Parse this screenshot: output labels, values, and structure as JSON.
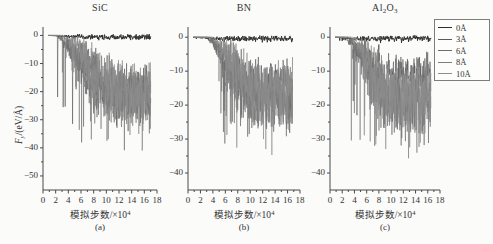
{
  "figure": {
    "background_color": "#fbfbfa",
    "axis_color": "#4a4a4a",
    "text_color": "#333333"
  },
  "legend": {
    "position": "top-right",
    "border_color": "#7d7d7d",
    "entries": [
      {
        "label": "0Å",
        "color": "#2e2e2e"
      },
      {
        "label": "3Å",
        "color": "#5a5a5a"
      },
      {
        "label": "6Å",
        "color": "#6e6e6e"
      },
      {
        "label": "8Å",
        "color": "#7e7e7e"
      },
      {
        "label": "10Å",
        "color": "#8d8d8d"
      }
    ]
  },
  "panels": [
    {
      "tag": "(a)",
      "title": "SiC",
      "title_html": "SiC",
      "xlabel": "模拟步数/×10",
      "xlabel_sup": "4",
      "ylabel": "F",
      "ylabel_sub": "y",
      "ylabel_rest": "/(eV/Å)",
      "xticks": [
        0,
        2,
        4,
        6,
        8,
        10,
        12,
        14,
        16,
        18
      ],
      "yticks": [
        0,
        -10,
        -20,
        -30,
        -40,
        -50
      ],
      "ytick_labels": [
        "0",
        "−10",
        "−20",
        "−30",
        "−40",
        "−50"
      ],
      "xlim": [
        0,
        18
      ],
      "ylim": [
        -55,
        3
      ]
    },
    {
      "tag": "(b)",
      "title": "BN",
      "title_html": "BN",
      "xlabel": "模拟步数/×10",
      "xlabel_sup": "4",
      "xticks": [
        0,
        2,
        4,
        6,
        8,
        10,
        12,
        14,
        16,
        18
      ],
      "yticks": [
        0,
        -10,
        -20,
        -30,
        -40
      ],
      "ytick_labels": [
        "0",
        "−10",
        "−20",
        "−30",
        "−40"
      ],
      "xlim": [
        0,
        18
      ],
      "ylim": [
        -45,
        3
      ]
    },
    {
      "tag": "(c)",
      "title": "Al2O3",
      "title_html": "Al<sub>2</sub>O<sub>3</sub>",
      "xlabel": "模拟步数/×10",
      "xlabel_sup": "4",
      "xticks": [
        0,
        2,
        4,
        6,
        8,
        10,
        12,
        14,
        16,
        18
      ],
      "yticks": [
        0,
        -10,
        -20,
        -30,
        -40
      ],
      "ytick_labels": [
        "0",
        "−10",
        "−20",
        "−30",
        "−40"
      ],
      "xlim": [
        0,
        18
      ],
      "ylim": [
        -45,
        3
      ]
    }
  ],
  "chart_data": {
    "type": "line",
    "title": "",
    "subplots": [
      {
        "tag": "(a)",
        "title": "SiC",
        "xlabel": "模拟步数/×10⁴",
        "ylabel": "F_y/(eV/Å)",
        "xlim": [
          0,
          18
        ],
        "ylim": [
          -55,
          3
        ],
        "xticks": [
          0,
          2,
          4,
          6,
          8,
          10,
          12,
          14,
          16,
          18
        ],
        "yticks": [
          0,
          -10,
          -20,
          -30,
          -40,
          -50
        ],
        "grid": false,
        "series": [
          {
            "name": "0Å",
            "color": "#2e2e2e",
            "x_start": 1.0,
            "x_end": 17.0,
            "mean_envelope": [
              0,
              -0.3,
              -0.4,
              -0.5,
              -0.6,
              -0.5,
              -0.4,
              -0.4,
              -0.4
            ],
            "noise_amplitude": 1.2,
            "description": "near-zero flat noisy trace along y=0"
          },
          {
            "name": "3Å",
            "color": "#5a5a5a",
            "x_start": 2.2,
            "x_end": 17.0,
            "mean_envelope": [
              0,
              -4,
              -9,
              -13,
              -16,
              -18,
              -19,
              -19,
              -18
            ],
            "noise_amplitude": 11,
            "min_value": -42
          },
          {
            "name": "6Å",
            "color": "#6e6e6e",
            "x_start": 2.6,
            "x_end": 17.0,
            "mean_envelope": [
              0,
              -5,
              -11,
              -16,
              -20,
              -22,
              -23,
              -22,
              -21
            ],
            "noise_amplitude": 13,
            "min_value": -48
          },
          {
            "name": "8Å",
            "color": "#7e7e7e",
            "x_start": 3.0,
            "x_end": 17.0,
            "mean_envelope": [
              0,
              -4,
              -10,
              -15,
              -19,
              -21,
              -22,
              -21,
              -20
            ],
            "noise_amplitude": 12,
            "min_value": -45
          },
          {
            "name": "10Å",
            "color": "#8d8d8d",
            "x_start": 3.4,
            "x_end": 17.0,
            "mean_envelope": [
              0,
              -3,
              -8,
              -13,
              -17,
              -19,
              -20,
              -19,
              -18
            ],
            "noise_amplitude": 12,
            "min_value": -44
          }
        ]
      },
      {
        "tag": "(b)",
        "title": "BN",
        "xlabel": "模拟步数/×10⁴",
        "ylabel": "",
        "xlim": [
          0,
          18
        ],
        "ylim": [
          -45,
          3
        ],
        "xticks": [
          0,
          2,
          4,
          6,
          8,
          10,
          12,
          14,
          16,
          18
        ],
        "yticks": [
          0,
          -10,
          -20,
          -30,
          -40
        ],
        "grid": false,
        "series": [
          {
            "name": "0Å",
            "color": "#2e2e2e",
            "x_start": 1.0,
            "x_end": 16.8,
            "mean_envelope": [
              0,
              -0.3,
              -0.4,
              -0.4,
              -0.5,
              -0.4,
              -0.3,
              -0.3,
              -0.3
            ],
            "noise_amplitude": 1.0,
            "description": "near-zero flat noisy trace along y=0"
          },
          {
            "name": "3Å",
            "color": "#5a5a5a",
            "x_start": 3.0,
            "x_end": 16.8,
            "mean_envelope": [
              0,
              -3,
              -7,
              -11,
              -13,
              -14,
              -14,
              -13,
              -12
            ],
            "noise_amplitude": 9,
            "min_value": -33
          },
          {
            "name": "6Å",
            "color": "#6e6e6e",
            "x_start": 3.4,
            "x_end": 16.8,
            "mean_envelope": [
              0,
              -5,
              -11,
              -15,
              -18,
              -19,
              -19,
              -18,
              -18
            ],
            "noise_amplitude": 11,
            "min_value": -39
          },
          {
            "name": "8Å",
            "color": "#7e7e7e",
            "x_start": 3.8,
            "x_end": 16.8,
            "mean_envelope": [
              0,
              -4,
              -10,
              -14,
              -17,
              -18,
              -18,
              -17,
              -17
            ],
            "noise_amplitude": 11,
            "min_value": -38
          },
          {
            "name": "10Å",
            "color": "#8d8d8d",
            "x_start": 4.0,
            "x_end": 16.8,
            "mean_envelope": [
              0,
              -3,
              -8,
              -12,
              -15,
              -16,
              -16,
              -16,
              -15
            ],
            "noise_amplitude": 10,
            "min_value": -40
          }
        ]
      },
      {
        "tag": "(c)",
        "title": "Al₂O₃",
        "xlabel": "模拟步数/×10⁴",
        "ylabel": "",
        "xlim": [
          0,
          18
        ],
        "ylim": [
          -45,
          3
        ],
        "xticks": [
          0,
          2,
          4,
          6,
          8,
          10,
          12,
          14,
          16,
          18
        ],
        "yticks": [
          0,
          -10,
          -20,
          -30,
          -40
        ],
        "grid": false,
        "series": [
          {
            "name": "0Å",
            "color": "#2e2e2e",
            "x_start": 1.0,
            "x_end": 16.5,
            "mean_envelope": [
              0,
              -0.3,
              -0.4,
              -0.4,
              -0.4,
              -0.4,
              -0.3,
              -0.3,
              -0.3
            ],
            "noise_amplitude": 1.0,
            "description": "near-zero flat noisy trace along y=0"
          },
          {
            "name": "3Å",
            "color": "#5a5a5a",
            "x_start": 2.4,
            "x_end": 16.5,
            "mean_envelope": [
              0,
              -3,
              -6,
              -9,
              -11,
              -12,
              -12,
              -11,
              -10
            ],
            "noise_amplitude": 8,
            "min_value": -30
          },
          {
            "name": "6Å",
            "color": "#6e6e6e",
            "x_start": 3.0,
            "x_end": 16.5,
            "mean_envelope": [
              0,
              -5,
              -11,
              -16,
              -19,
              -20,
              -20,
              -19,
              -18
            ],
            "noise_amplitude": 12,
            "min_value": -41
          },
          {
            "name": "8Å",
            "color": "#7e7e7e",
            "x_start": 3.4,
            "x_end": 16.5,
            "mean_envelope": [
              0,
              -4,
              -10,
              -15,
              -18,
              -19,
              -19,
              -18,
              -17
            ],
            "noise_amplitude": 11,
            "min_value": -40
          },
          {
            "name": "10Å",
            "color": "#8d8d8d",
            "x_start": 3.8,
            "x_end": 16.5,
            "mean_envelope": [
              0,
              -4,
              -9,
              -14,
              -17,
              -18,
              -18,
              -17,
              -16
            ],
            "noise_amplitude": 11,
            "min_value": -38
          }
        ]
      }
    ]
  }
}
